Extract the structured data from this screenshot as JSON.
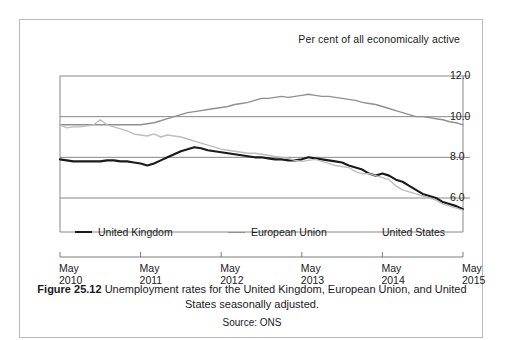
{
  "figure": {
    "axis_header": "Per cent of all economically active",
    "caption_number": "Figure 25.12",
    "caption_text": "Unemployment rates for the United Kingdom, European Union, and United States seasonally adjusted.",
    "source": "Source: ONS"
  },
  "chart_data": {
    "type": "line",
    "title": "Unemployment rates for the United Kingdom, European Union, and United States seasonally adjusted.",
    "subtitle": "Per cent of all economically active",
    "xlabel": "",
    "ylabel": "Per cent of all economically active",
    "ylim": [
      4.8,
      12.0
    ],
    "xlim": [
      0,
      60
    ],
    "grid": true,
    "gridlines_y": [
      6.0,
      8.0,
      10.0,
      12.0
    ],
    "ytick_labels": [
      "12.0",
      "10.0",
      "8.0",
      "6.0"
    ],
    "ytick_values": [
      12.0,
      10.0,
      8.0,
      6.0
    ],
    "xtick_labels": [
      {
        "month": "May",
        "year": "2010"
      },
      {
        "month": "May",
        "year": "2011"
      },
      {
        "month": "May",
        "year": "2012"
      },
      {
        "month": "May",
        "year": "2013"
      },
      {
        "month": "May",
        "year": "2014"
      },
      {
        "month": "May",
        "year": "2015"
      }
    ],
    "xtick_values": [
      0,
      12,
      24,
      36,
      48,
      60
    ],
    "legend_position": "inside-bottom",
    "x": [
      0,
      1,
      2,
      3,
      4,
      5,
      6,
      7,
      8,
      9,
      10,
      11,
      12,
      13,
      14,
      15,
      16,
      17,
      18,
      19,
      20,
      21,
      22,
      23,
      24,
      25,
      26,
      27,
      28,
      29,
      30,
      31,
      32,
      33,
      34,
      35,
      36,
      37,
      38,
      39,
      40,
      41,
      42,
      43,
      44,
      45,
      46,
      47,
      48,
      49,
      50,
      51,
      52,
      53,
      54,
      55,
      56,
      57,
      58,
      59,
      60
    ],
    "series": [
      {
        "name": "United Kingdom",
        "color": "#1a1a1a",
        "width": 2.1,
        "values": [
          7.9,
          7.85,
          7.8,
          7.8,
          7.8,
          7.8,
          7.8,
          7.85,
          7.85,
          7.8,
          7.8,
          7.75,
          7.7,
          7.6,
          7.7,
          7.85,
          8.0,
          8.15,
          8.3,
          8.4,
          8.5,
          8.45,
          8.35,
          8.3,
          8.25,
          8.2,
          8.15,
          8.1,
          8.05,
          8.0,
          8.0,
          7.95,
          7.9,
          7.9,
          7.85,
          7.85,
          7.9,
          8.0,
          7.95,
          7.9,
          7.85,
          7.8,
          7.75,
          7.6,
          7.5,
          7.4,
          7.2,
          7.1,
          7.2,
          7.1,
          6.9,
          6.8,
          6.6,
          6.4,
          6.2,
          6.1,
          6.0,
          5.8,
          5.7,
          5.6,
          5.45
        ],
        "style": "solid"
      },
      {
        "name": "European Union",
        "color": "#909090",
        "width": 1.4,
        "values": [
          9.6,
          9.6,
          9.6,
          9.6,
          9.6,
          9.6,
          9.6,
          9.6,
          9.6,
          9.6,
          9.6,
          9.6,
          9.6,
          9.65,
          9.7,
          9.8,
          9.9,
          10.0,
          10.1,
          10.2,
          10.25,
          10.3,
          10.35,
          10.4,
          10.45,
          10.5,
          10.6,
          10.65,
          10.7,
          10.8,
          10.9,
          10.9,
          10.95,
          11.0,
          10.95,
          11.0,
          11.05,
          11.1,
          11.05,
          11.0,
          11.0,
          10.95,
          10.9,
          10.85,
          10.8,
          10.7,
          10.65,
          10.6,
          10.5,
          10.4,
          10.3,
          10.2,
          10.1,
          10.0,
          10.0,
          9.95,
          9.9,
          9.85,
          9.75,
          9.7,
          9.6
        ],
        "style": "solid"
      },
      {
        "name": "United States",
        "color": "#bdbdbd",
        "width": 1.4,
        "values": [
          9.6,
          9.45,
          9.5,
          9.5,
          9.55,
          9.6,
          9.85,
          9.6,
          9.5,
          9.4,
          9.3,
          9.15,
          9.1,
          9.05,
          9.15,
          9.0,
          9.1,
          9.05,
          9.0,
          8.9,
          8.8,
          8.7,
          8.6,
          8.5,
          8.4,
          8.35,
          8.3,
          8.25,
          8.2,
          8.2,
          8.15,
          8.1,
          8.05,
          8.0,
          7.95,
          7.85,
          7.8,
          7.85,
          7.9,
          7.8,
          7.7,
          7.6,
          7.55,
          7.5,
          7.3,
          7.2,
          7.2,
          7.1,
          7.0,
          6.9,
          6.6,
          6.4,
          6.3,
          6.2,
          6.1,
          6.0,
          5.9,
          5.7,
          5.6,
          5.5,
          5.4
        ],
        "style": "solid"
      }
    ]
  },
  "legend": [
    {
      "label": "United Kingdom",
      "color": "#1a1a1a",
      "thickness": "2.2px"
    },
    {
      "label": "European Union",
      "color": "#909090",
      "thickness": "1.5px"
    },
    {
      "label": "United States",
      "color": "#c4c4c4",
      "thickness": "1.5px"
    }
  ]
}
